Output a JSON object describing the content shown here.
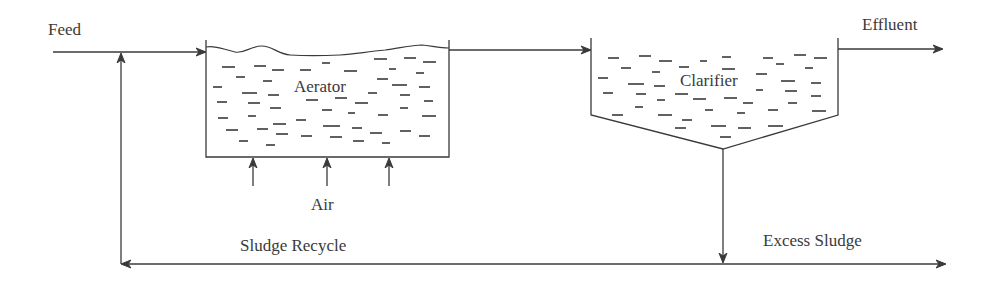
{
  "diagram": {
    "labels": {
      "feed": "Feed",
      "effluent": "Effluent",
      "aerator": "Aerator",
      "clarifier": "Clarifier",
      "air": "Air",
      "sludge_recycle": "Sludge Recycle",
      "excess_sludge": "Excess Sludge"
    },
    "nodes": [
      {
        "id": "aerator",
        "label": "Aerator",
        "shape": "open-top tank with wavy liquid surface"
      },
      {
        "id": "clarifier",
        "label": "Clarifier",
        "shape": "tank with conical (V) bottom"
      }
    ],
    "edges": [
      {
        "from": "feed",
        "to": "aerator",
        "label": "Feed"
      },
      {
        "from": "aerator",
        "to": "clarifier",
        "label": ""
      },
      {
        "from": "clarifier",
        "to": "effluent",
        "label": "Effluent"
      },
      {
        "from": "air",
        "to": "aerator",
        "label": "Air",
        "count": 3
      },
      {
        "from": "clarifier",
        "to": "bottom-line",
        "label": ""
      },
      {
        "from": "bottom-line",
        "to": "feed",
        "label": "Sludge Recycle"
      },
      {
        "from": "bottom-line",
        "to": "excess",
        "label": "Excess Sludge"
      }
    ],
    "colors": {
      "stroke": "#3a3a3a",
      "background": "#ffffff"
    }
  }
}
